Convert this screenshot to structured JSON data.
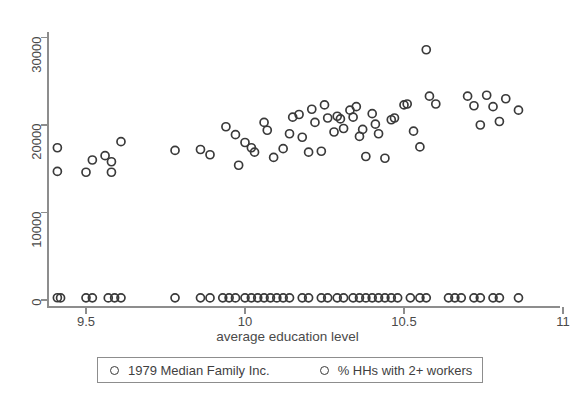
{
  "chart_data": {
    "type": "scatter",
    "title": "",
    "xlabel": "average education level",
    "ylabel": "",
    "xlim": [
      9.37,
      11.02
    ],
    "ylim": [
      0,
      31500
    ],
    "grid": false,
    "legend_position": "bottom",
    "x_ticks": [
      9.5,
      10,
      10.5,
      11
    ],
    "x_tick_labels": [
      "9.5",
      "10",
      "10.5",
      "11"
    ],
    "y_ticks": [
      0,
      10000,
      20000,
      30000
    ],
    "y_tick_labels": [
      "0",
      "10000",
      "20000",
      "30000"
    ],
    "marker": "open-circle",
    "marker_color": "#3a3a3a",
    "axis_color": "#8d8d8d",
    "series": [
      {
        "name": "1979 Median Family Inc.",
        "points": [
          [
            9.41,
            17400
          ],
          [
            9.41,
            14700
          ],
          [
            9.5,
            14600
          ],
          [
            9.52,
            16000
          ],
          [
            9.56,
            16500
          ],
          [
            9.58,
            15800
          ],
          [
            9.58,
            14600
          ],
          [
            9.61,
            18100
          ],
          [
            9.78,
            17100
          ],
          [
            9.86,
            17200
          ],
          [
            9.89,
            16600
          ],
          [
            9.94,
            19800
          ],
          [
            9.97,
            18900
          ],
          [
            9.98,
            15400
          ],
          [
            10.0,
            18000
          ],
          [
            10.02,
            17400
          ],
          [
            10.03,
            16900
          ],
          [
            10.06,
            20300
          ],
          [
            10.07,
            19400
          ],
          [
            10.09,
            16300
          ],
          [
            10.12,
            17300
          ],
          [
            10.14,
            19000
          ],
          [
            10.15,
            20900
          ],
          [
            10.17,
            21200
          ],
          [
            10.18,
            18600
          ],
          [
            10.2,
            16900
          ],
          [
            10.21,
            21800
          ],
          [
            10.22,
            20300
          ],
          [
            10.24,
            17000
          ],
          [
            10.25,
            22300
          ],
          [
            10.26,
            20800
          ],
          [
            10.28,
            19200
          ],
          [
            10.29,
            21000
          ],
          [
            10.3,
            20700
          ],
          [
            10.31,
            19600
          ],
          [
            10.33,
            21700
          ],
          [
            10.34,
            20900
          ],
          [
            10.35,
            22100
          ],
          [
            10.36,
            18700
          ],
          [
            10.37,
            19500
          ],
          [
            10.38,
            16400
          ],
          [
            10.4,
            21300
          ],
          [
            10.41,
            20100
          ],
          [
            10.42,
            19000
          ],
          [
            10.44,
            16200
          ],
          [
            10.46,
            20600
          ],
          [
            10.47,
            20800
          ],
          [
            10.5,
            22300
          ],
          [
            10.51,
            22400
          ],
          [
            10.53,
            19300
          ],
          [
            10.55,
            17500
          ],
          [
            10.57,
            28600
          ],
          [
            10.58,
            23300
          ],
          [
            10.6,
            22400
          ],
          [
            10.7,
            23300
          ],
          [
            10.72,
            22200
          ],
          [
            10.74,
            20000
          ],
          [
            10.76,
            23400
          ],
          [
            10.78,
            22100
          ],
          [
            10.8,
            20400
          ],
          [
            10.82,
            23000
          ],
          [
            10.86,
            21700
          ]
        ]
      },
      {
        "name": "% HHs with 2+ workers",
        "points": [
          [
            9.41,
            260
          ],
          [
            9.42,
            240
          ],
          [
            9.5,
            250
          ],
          [
            9.52,
            250
          ],
          [
            9.57,
            240
          ],
          [
            9.59,
            250
          ],
          [
            9.61,
            250
          ],
          [
            9.78,
            250
          ],
          [
            9.86,
            250
          ],
          [
            9.89,
            240
          ],
          [
            9.93,
            250
          ],
          [
            9.95,
            250
          ],
          [
            9.97,
            240
          ],
          [
            10.0,
            250
          ],
          [
            10.02,
            250
          ],
          [
            10.04,
            250
          ],
          [
            10.06,
            250
          ],
          [
            10.08,
            250
          ],
          [
            10.1,
            240
          ],
          [
            10.12,
            250
          ],
          [
            10.14,
            250
          ],
          [
            10.18,
            250
          ],
          [
            10.2,
            250
          ],
          [
            10.24,
            250
          ],
          [
            10.26,
            250
          ],
          [
            10.29,
            250
          ],
          [
            10.31,
            250
          ],
          [
            10.34,
            250
          ],
          [
            10.36,
            250
          ],
          [
            10.38,
            240
          ],
          [
            10.4,
            250
          ],
          [
            10.42,
            250
          ],
          [
            10.44,
            250
          ],
          [
            10.46,
            250
          ],
          [
            10.48,
            250
          ],
          [
            10.52,
            250
          ],
          [
            10.55,
            250
          ],
          [
            10.57,
            250
          ],
          [
            10.64,
            250
          ],
          [
            10.66,
            250
          ],
          [
            10.68,
            250
          ],
          [
            10.72,
            250
          ],
          [
            10.74,
            250
          ],
          [
            10.78,
            250
          ],
          [
            10.8,
            250
          ],
          [
            10.86,
            250
          ]
        ]
      }
    ]
  },
  "axis": {
    "x_title": "average education level"
  },
  "legend": {
    "entries": [
      {
        "label": "1979 Median Family Inc."
      },
      {
        "label": "% HHs with 2+ workers"
      }
    ]
  }
}
